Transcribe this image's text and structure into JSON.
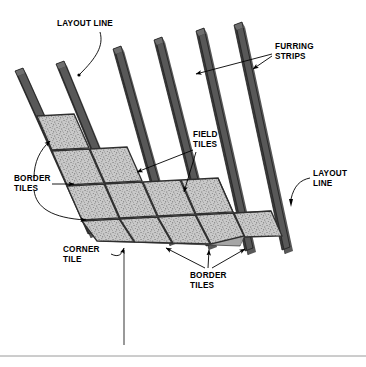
{
  "diagram": {
    "background_color": "#ffffff",
    "labels": {
      "layout_line_top": {
        "line1": "LAYOUT LINE"
      },
      "furring_strips": {
        "line1": "FURRING",
        "line2": "STRIPS"
      },
      "field_tiles": {
        "line1": "FIELD",
        "line2": "TILES"
      },
      "layout_line_right": {
        "line1": "LAYOUT",
        "line2": "LINE"
      },
      "border_tiles_left": {
        "line1": "BORDER",
        "line2": "TILES"
      },
      "corner_tile": {
        "line1": "CORNER",
        "line2": "TILE"
      },
      "border_tiles_bottom": {
        "line1": "BORDER",
        "line2": "TILES"
      }
    },
    "colors": {
      "strip_face": "#3b3b3b",
      "strip_top": "#6e6e6e",
      "strip_edge": "#1c1c1c",
      "tile_fill": "#c9c9c9",
      "tile_speckle": "#5a5a5a",
      "grout": "#2f2f2f",
      "tile_edge": "#8f8f8f",
      "leader": "#000000",
      "rule": "#9a9a9a",
      "text": "#000000"
    },
    "counts": {
      "furring_strips": 6,
      "tile_rows": 4,
      "tiles_visible": 13
    },
    "footer_rule": {
      "present": true
    },
    "plumb_line": {
      "present": true
    }
  }
}
